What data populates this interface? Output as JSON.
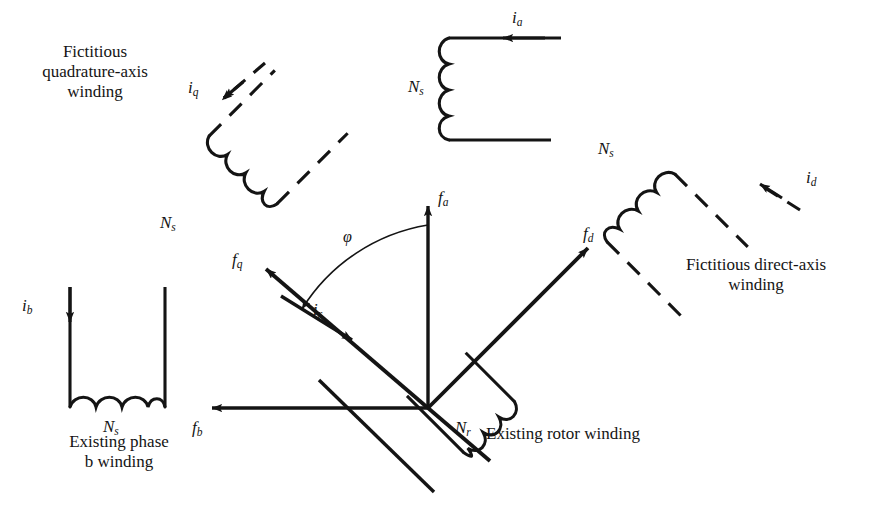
{
  "figure": {
    "kind": "machine-winding-vector-diagram",
    "background_color": "#ffffff",
    "stroke_color": "#141414",
    "width": 881,
    "height": 525
  },
  "captions": {
    "quadrature_axis": "Fictitious\nquadrature-axis\nwinding",
    "direct_axis": "Fictitious direct-axis\nwinding",
    "phase_b": "Existing phase\nb winding",
    "rotor": "Existing rotor winding"
  },
  "symbols": {
    "i_a": {
      "base": "i",
      "sub": "a"
    },
    "i_b": {
      "base": "i",
      "sub": "b"
    },
    "i_q": {
      "base": "i",
      "sub": "q"
    },
    "i_d": {
      "base": "i",
      "sub": "d"
    },
    "i_r": {
      "base": "i",
      "sub": "r"
    },
    "f_a": {
      "base": "f",
      "sub": "a"
    },
    "f_b": {
      "base": "f",
      "sub": "b"
    },
    "f_q": {
      "base": "f",
      "sub": "q"
    },
    "f_d": {
      "base": "f",
      "sub": "d"
    },
    "N_s_top": {
      "base": "N",
      "sub": "s"
    },
    "N_s_q": {
      "base": "N",
      "sub": "s"
    },
    "N_s_d": {
      "base": "N",
      "sub": "s"
    },
    "N_s_b": {
      "base": "N",
      "sub": "s"
    },
    "N_r": {
      "base": "N",
      "sub": "r"
    },
    "phi": "φ"
  },
  "windings": [
    {
      "name": "phase-a-stator-winding",
      "turns_label": "Ns",
      "current_label": "ia",
      "style": "solid",
      "orientation": "c-open-right"
    },
    {
      "name": "phase-b-stator-winding",
      "turns_label": "Ns",
      "current_label": "ib",
      "style": "solid",
      "orientation": "u-open-up"
    },
    {
      "name": "quadrature-axis-winding",
      "turns_label": "Ns",
      "current_label": "iq",
      "style": "dashed",
      "orientation": "rotated-minus-45"
    },
    {
      "name": "direct-axis-winding",
      "turns_label": "Ns",
      "current_label": "id",
      "style": "dashed",
      "orientation": "rotated-plus-45"
    },
    {
      "name": "rotor-winding",
      "turns_label": "Nr",
      "current_label": "ir",
      "style": "solid",
      "orientation": "rotated-plus-45"
    }
  ],
  "vectors": [
    {
      "name": "f-a-vector",
      "label": "fa",
      "direction": "up",
      "origin": [
        428,
        408
      ],
      "tip": [
        428,
        196
      ]
    },
    {
      "name": "f-b-vector",
      "label": "fb",
      "direction": "left",
      "origin": [
        428,
        408
      ],
      "tip": [
        202,
        408
      ]
    },
    {
      "name": "f-q-vector",
      "label": "fq",
      "direction": "up-left",
      "origin": [
        428,
        408
      ],
      "tip": [
        258,
        262
      ]
    },
    {
      "name": "f-d-vector",
      "label": "fd",
      "direction": "up-right",
      "origin": [
        428,
        408
      ],
      "tip": [
        578,
        238
      ]
    },
    {
      "name": "i-r-vector",
      "label": "ir",
      "direction": "down-right",
      "origin": [
        281,
        296
      ],
      "tip": [
        360,
        345
      ]
    }
  ],
  "angle": {
    "name": "phi-angle",
    "label": "φ",
    "from": "f-a-vector",
    "to": "f-q-vector"
  }
}
